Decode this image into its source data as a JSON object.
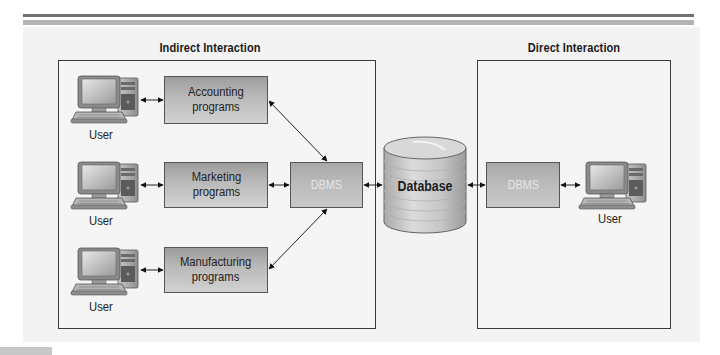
{
  "figure": {
    "sections": {
      "indirect": {
        "title": "Indirect Interaction"
      },
      "direct": {
        "title": "Direct Interaction"
      }
    },
    "programs": [
      {
        "label_line1": "Accounting",
        "label_line2": "programs"
      },
      {
        "label_line1": "Marketing",
        "label_line2": "programs"
      },
      {
        "label_line1": "Manufacturing",
        "label_line2": "programs"
      }
    ],
    "users": [
      {
        "label": "User"
      },
      {
        "label": "User"
      },
      {
        "label": "User"
      },
      {
        "label": "User"
      }
    ],
    "dbms_left": {
      "label": "DBMS"
    },
    "dbms_right": {
      "label": "DBMS"
    },
    "database": {
      "label": "Database"
    },
    "icons": {
      "computer": "desktop-computer-icon",
      "database": "database-cylinder-icon",
      "arrow": "bidirectional-arrow"
    },
    "colors": {
      "frame_border": "#3a3a3a",
      "panel_bg": "#f3f3f3",
      "box_gradient_top": "#9c9c9c",
      "box_gradient_bottom": "#d2d2d2",
      "dbms_text": "#e6e6e6",
      "header_bar_dark": "#6f6f6f",
      "header_bar_light": "#b3b3b3"
    }
  }
}
